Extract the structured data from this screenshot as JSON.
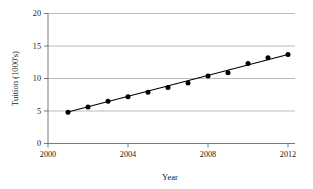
{
  "chart_data": {
    "type": "scatter",
    "title": "",
    "xlabel": "Year",
    "ylabel": "Tuition (1000's)",
    "xlim": [
      2000,
      2012
    ],
    "ylim": [
      0,
      20
    ],
    "xticks": [
      2000,
      2004,
      2008,
      2012
    ],
    "xtick_labels": [
      "2000",
      "2004",
      "2008",
      "2012"
    ],
    "yticks": [
      0,
      5,
      10,
      15,
      20
    ],
    "ytick_labels": [
      "0",
      "5",
      "10",
      "15",
      "20"
    ],
    "grid": "horizontal",
    "legend": "none",
    "x": [
      2001,
      2002,
      2003,
      2004,
      2005,
      2006,
      2007,
      2008,
      2009,
      2010,
      2011,
      2012
    ],
    "values": [
      4.8,
      5.6,
      6.5,
      7.2,
      7.9,
      8.6,
      9.3,
      10.4,
      10.9,
      12.3,
      13.2,
      13.7
    ],
    "series": [
      {
        "name": "Tuition",
        "marker": "filled-circle",
        "color": "#000000",
        "values": [
          4.8,
          5.6,
          6.5,
          7.2,
          7.9,
          8.6,
          9.3,
          10.4,
          10.9,
          12.3,
          13.2,
          13.7
        ]
      },
      {
        "name": "Trend line",
        "type": "line",
        "color": "#000000",
        "x": [
          2001,
          2012
        ],
        "values": [
          4.85,
          13.7
        ]
      }
    ],
    "colors": {
      "marker": "#000000",
      "line": "#000000",
      "grid": "#a9a9a9",
      "axis": "#6b6b6b",
      "text": "#1a1a1a",
      "background": "#ffffff"
    }
  }
}
